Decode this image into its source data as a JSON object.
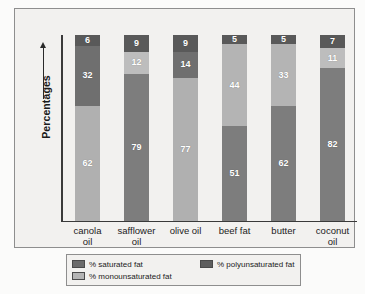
{
  "chart_data": {
    "type": "bar",
    "subtype": "stacked-100-percent",
    "title": "",
    "xlabel": "",
    "ylabel": "Percentages",
    "ylim": [
      0,
      100
    ],
    "grid": false,
    "legend_position": "bottom",
    "categories": [
      "canola oil",
      "safflower oil",
      "olive oil",
      "beef fat",
      "butter",
      "coconut oil"
    ],
    "series": [
      {
        "name": "% saturated fat",
        "color": "#595959",
        "values": [
          6,
          9,
          9,
          51,
          62,
          82
        ]
      },
      {
        "name": "% monounsaturated fat",
        "color": "#b4b4b4",
        "values": [
          62,
          12,
          77,
          44,
          33,
          11
        ]
      },
      {
        "name": "% polyunsaturated fat",
        "color": "#7d7d7d",
        "values": [
          32,
          79,
          14,
          5,
          5,
          7
        ]
      }
    ],
    "bars": [
      {
        "category": "canola oil",
        "label_line1": "canola",
        "label_line2": "oil",
        "segments": [
          {
            "series": "% saturated fat",
            "value": 6,
            "color": "#595959"
          },
          {
            "series": "% polyunsaturated fat",
            "value": 32,
            "color": "#6f6f6f"
          },
          {
            "series": "% monounsaturated fat",
            "value": 62,
            "color": "#b0b0b0"
          }
        ]
      },
      {
        "category": "safflower oil",
        "label_line1": "safflower",
        "label_line2": "oil",
        "segments": [
          {
            "series": "% saturated fat",
            "value": 9,
            "color": "#595959"
          },
          {
            "series": "% monounsaturated fat",
            "value": 12,
            "color": "#bdbdbd"
          },
          {
            "series": "% polyunsaturated fat",
            "value": 79,
            "color": "#7d7d7d"
          }
        ]
      },
      {
        "category": "olive oil",
        "label_line1": "olive oil",
        "label_line2": "",
        "segments": [
          {
            "series": "% saturated fat",
            "value": 9,
            "color": "#595959"
          },
          {
            "series": "% polyunsaturated fat",
            "value": 14,
            "color": "#6f6f6f"
          },
          {
            "series": "% monounsaturated fat",
            "value": 77,
            "color": "#b0b0b0"
          }
        ]
      },
      {
        "category": "beef fat",
        "label_line1": "beef fat",
        "label_line2": "",
        "segments": [
          {
            "series": "% polyunsaturated fat",
            "value": 5,
            "color": "#595959"
          },
          {
            "series": "% monounsaturated fat",
            "value": 44,
            "color": "#b4b4b4"
          },
          {
            "series": "% saturated fat",
            "value": 51,
            "color": "#7d7d7d"
          }
        ]
      },
      {
        "category": "butter",
        "label_line1": "butter",
        "label_line2": "",
        "segments": [
          {
            "series": "% polyunsaturated fat",
            "value": 5,
            "color": "#595959"
          },
          {
            "series": "% monounsaturated fat",
            "value": 33,
            "color": "#b4b4b4"
          },
          {
            "series": "% saturated fat",
            "value": 62,
            "color": "#7d7d7d"
          }
        ]
      },
      {
        "category": "coconut oil",
        "label_line1": "coconut",
        "label_line2": "oil",
        "segments": [
          {
            "series": "% polyunsaturated fat",
            "value": 7,
            "color": "#595959"
          },
          {
            "series": "% monounsaturated fat",
            "value": 11,
            "color": "#bdbdbd"
          },
          {
            "series": "% saturated fat",
            "value": 82,
            "color": "#7d7d7d"
          }
        ]
      }
    ]
  },
  "axis": {
    "y_title": "Percentages"
  },
  "legend": {
    "items": [
      {
        "label": "% saturated fat",
        "color": "#6b6b6b"
      },
      {
        "label": "% polyunsaturated fat",
        "color": "#5e5e5e"
      },
      {
        "label": "% monounsaturated fat",
        "color": "#b4b4b4"
      }
    ]
  }
}
